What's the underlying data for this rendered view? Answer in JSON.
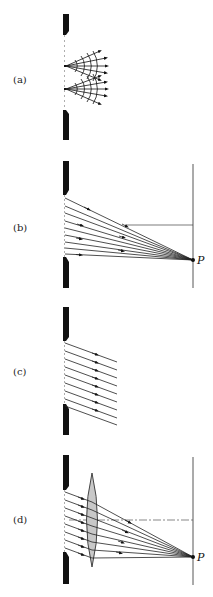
{
  "figure": {
    "panels": [
      {
        "id": "a",
        "label": "(a)",
        "description": "Huygens wavelets from two points in a slit"
      },
      {
        "id": "b",
        "label": "(b)",
        "description": "Rays from slit converging at point P on a distant screen",
        "point_label": "P"
      },
      {
        "id": "c",
        "label": "(c)",
        "description": "Parallel rays leaving the slit at an angle"
      },
      {
        "id": "d",
        "label": "(d)",
        "description": "Lens focusing parallel rays onto point P on screen",
        "point_label": "P"
      }
    ],
    "colors": {
      "ink": "#111111",
      "lens_fill": "#c8c8c8",
      "background": "#ffffff"
    }
  }
}
